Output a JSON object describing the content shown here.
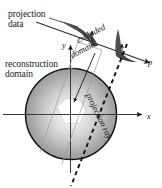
{
  "figure": {
    "background_color": "#ffffff",
    "ink_color": "#1a1a1a",
    "spike_fill_color": "#4a4a4a",
    "disk_edge_color": "#111111",
    "labels": {
      "projection_data_line1": "projection",
      "projection_data_line2": "data",
      "reconstruction_domain_line1": "reconstruction",
      "reconstruction_domain_line2": "domain",
      "excluded_line1": "excluded",
      "excluded_line2": "domain",
      "projection_ray": "projection ray"
    },
    "axes": {
      "x_label": "x",
      "y_label": "y",
      "p_label": "p"
    },
    "elements": {
      "disk_name": "reconstruction-disk",
      "hole_name": "excluded-hexagon",
      "ray_name": "projection-ray-dashed-line",
      "band_name": "excluded-domain-band",
      "spike1_name": "projection-data-spike-left",
      "spike2_name": "projection-data-spike-right"
    }
  }
}
